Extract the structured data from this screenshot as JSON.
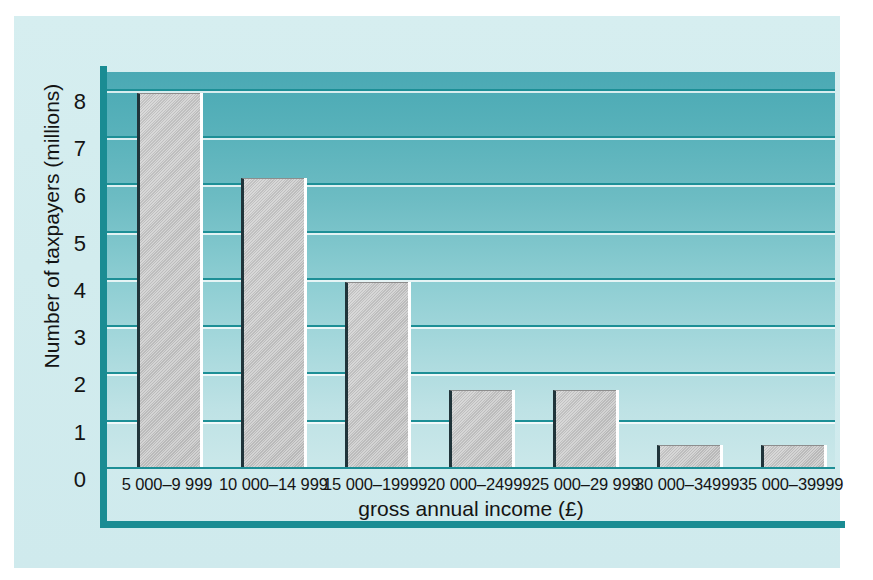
{
  "chart_data": {
    "type": "bar",
    "title": "",
    "xlabel": "gross annual income (£)",
    "ylabel": "Number of taxpayers (millions)",
    "categories": [
      "5 000–9 999",
      "10 000–14 999",
      "15 000–19999",
      "20 000–24999",
      "25 000–29 999",
      "30 000–34999",
      "35 000–39999"
    ],
    "values": [
      7.9,
      6.1,
      3.9,
      1.6,
      1.6,
      0.45,
      0.45
    ],
    "ylim": [
      0,
      8.4
    ],
    "yticks": [
      0,
      1,
      2,
      3,
      4,
      5,
      6,
      7,
      8
    ],
    "ytick_labels": [
      "0",
      "1",
      "2",
      "3",
      "4",
      "5",
      "6",
      "7",
      "8"
    ],
    "grid": true,
    "grid_axis": "y",
    "legend": false,
    "legend_position": "none",
    "bar_color": "#c4c4c4",
    "bar_edge_color": "#20343a",
    "gridline_color": "#1d8f96",
    "plot_bg_top_color": "#4aa9b4",
    "plot_bg_bottom_color": "#cbe8ea",
    "panel_color": "#d2ecee",
    "frame_color": "#1a8c93",
    "text_color": "#141414"
  }
}
